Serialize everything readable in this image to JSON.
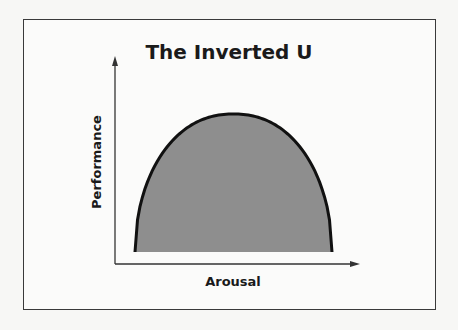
{
  "chart_data": {
    "type": "area",
    "title": "The Inverted U",
    "xlabel": "Arousal",
    "ylabel": "Performance",
    "shape": "inverted-parabola",
    "x": [
      0,
      0.1,
      0.2,
      0.3,
      0.4,
      0.5,
      0.6,
      0.7,
      0.8,
      0.9,
      1.0
    ],
    "y": [
      0,
      0.36,
      0.64,
      0.84,
      0.96,
      1.0,
      0.96,
      0.84,
      0.64,
      0.36,
      0
    ],
    "fill_color": "#8e8e8e",
    "line_color": "#111111",
    "ticks": "none",
    "grid": false
  }
}
